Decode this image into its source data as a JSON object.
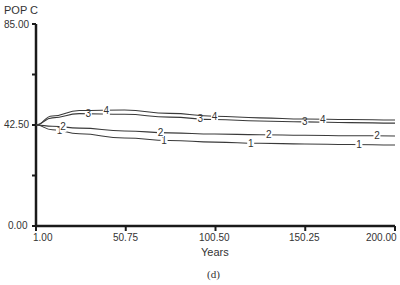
{
  "chart_data": {
    "type": "line",
    "title": "",
    "ylabel": "POP C",
    "xlabel": "Years",
    "caption": "(d)",
    "xlim": [
      1.0,
      200.0
    ],
    "ylim": [
      0.0,
      85.0
    ],
    "x_ticks": [
      "1.00",
      "50.75",
      "100.50",
      "150.25",
      "200.00"
    ],
    "y_ticks": [
      "0.00",
      "42.50",
      "85.00"
    ],
    "grid": false,
    "legend": "inline numeric markers 1-4 on curves",
    "x": [
      1,
      10,
      25,
      50,
      75,
      100,
      125,
      150,
      175,
      200
    ],
    "series": [
      {
        "name": "1",
        "values": [
          42.5,
          40.5,
          38.8,
          37.0,
          36.0,
          35.3,
          34.8,
          34.5,
          34.3,
          34.1
        ]
      },
      {
        "name": "2",
        "values": [
          42.5,
          42.0,
          41.2,
          40.0,
          39.2,
          38.7,
          38.4,
          38.2,
          38.0,
          37.9
        ]
      },
      {
        "name": "3",
        "values": [
          42.5,
          45.5,
          47.3,
          47.0,
          45.8,
          44.8,
          44.2,
          43.8,
          43.5,
          43.3
        ]
      },
      {
        "name": "4",
        "values": [
          42.5,
          46.3,
          48.6,
          48.8,
          47.4,
          46.2,
          45.5,
          45.0,
          44.8,
          44.6
        ]
      }
    ]
  }
}
